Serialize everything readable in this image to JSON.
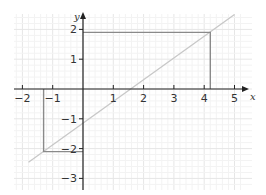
{
  "chart_data": {
    "type": "line",
    "title": "",
    "xlabel": "x",
    "ylabel": "y",
    "xlim": [
      -2.3,
      5.3
    ],
    "ylim": [
      -3.3,
      2.6
    ],
    "grid": true,
    "x_ticks": [
      "-2",
      "-1",
      "1",
      "2",
      "3",
      "4",
      "5"
    ],
    "y_ticks": [
      "2",
      "1",
      "-1",
      "-2",
      "-3"
    ],
    "series": [
      {
        "name": "line",
        "color": "#c8c8c8",
        "points": [
          [
            -1.8,
            -2.46
          ],
          [
            5.0,
            2.5
          ]
        ]
      },
      {
        "name": "upper-rectangle",
        "color": "#8a8a8a",
        "points": [
          [
            0,
            1.9
          ],
          [
            4.2,
            1.9
          ],
          [
            4.2,
            0
          ]
        ]
      },
      {
        "name": "lower-rectangle",
        "color": "#8a8a8a",
        "points": [
          [
            0,
            -2.1
          ],
          [
            -1.3,
            -2.1
          ],
          [
            -1.3,
            0
          ]
        ]
      }
    ]
  },
  "axes": {
    "x_name": "x",
    "y_name": "y",
    "x_tick_labels": [
      "−2",
      "−1",
      "1",
      "2",
      "3",
      "4",
      "5"
    ],
    "y_tick_labels": [
      "2",
      "1",
      "−1",
      "−2",
      "−3"
    ]
  }
}
